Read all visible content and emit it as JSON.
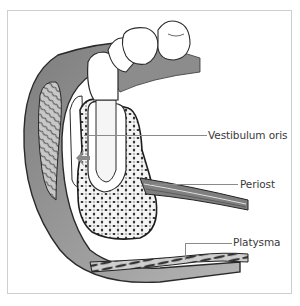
{
  "figure": {
    "type": "anatomical cross-section of lower jaw (mandible) with tooth",
    "frame_color": "#cfcfcf"
  },
  "labels": [
    {
      "id": "vestibulum-oris",
      "text": "Vestibulum oris"
    },
    {
      "id": "periost",
      "text": "Periost"
    },
    {
      "id": "platysma",
      "text": "Platysma"
    }
  ],
  "colors": {
    "soft_tissue": "#9a9a9a",
    "soft_tissue_light": "#bdbdbd",
    "tooth": "#ffffff",
    "outline": "#2a2a2a",
    "bone_bg": "#f2f2f2",
    "leader_line": "#8a8a8a"
  }
}
